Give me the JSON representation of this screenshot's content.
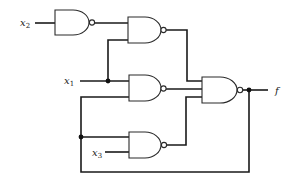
{
  "diagram": {
    "type": "logic-circuit",
    "gate_type": "NAND",
    "colors": {
      "wire": "#1a1a1a",
      "background": "#ffffff"
    },
    "inputs": [
      {
        "id": "x2",
        "base": "x",
        "sub": "2"
      },
      {
        "id": "x1",
        "base": "x",
        "sub": "1"
      },
      {
        "id": "x3",
        "base": "x",
        "sub": "3"
      }
    ],
    "output": {
      "id": "f",
      "label": "f"
    },
    "gates": [
      {
        "id": "G1",
        "type": "NAND",
        "inputs": [
          "x2"
        ]
      },
      {
        "id": "G2",
        "type": "NAND",
        "inputs": [
          "G1",
          "x1"
        ]
      },
      {
        "id": "G3",
        "type": "NAND",
        "inputs": [
          "x1",
          "f"
        ]
      },
      {
        "id": "G4",
        "type": "NAND",
        "inputs": [
          "G2",
          "G3",
          "G5"
        ]
      },
      {
        "id": "G5",
        "type": "NAND",
        "inputs": [
          "f",
          "x3"
        ]
      }
    ],
    "feedback": "f output fed back to G3 and G5 inputs"
  }
}
